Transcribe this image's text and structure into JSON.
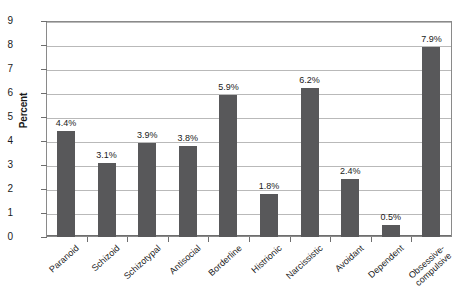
{
  "chart_data": {
    "type": "bar",
    "title": "",
    "xlabel": "",
    "ylabel": "Percent",
    "ylim": [
      0,
      9
    ],
    "yticks": [
      "0",
      "1",
      "2",
      "3",
      "4",
      "5",
      "6",
      "7",
      "8",
      "9"
    ],
    "grid": true,
    "legend": "none",
    "bar_color": "#58585a",
    "gridline_color": "#b9b9b9",
    "plot_border_color": "#8a8a8a",
    "value_suffix": "%",
    "categories": [
      "Paranoid",
      "Schizoid",
      "Schizotypal",
      "Antisocial",
      "Borderline",
      "Histrionic",
      "Narcissistic",
      "Avoidant",
      "Dependent",
      "Obsessive-\ncompulsive"
    ],
    "values": [
      4.4,
      3.1,
      3.9,
      3.8,
      5.9,
      1.8,
      6.2,
      2.4,
      0.5,
      7.9
    ],
    "value_labels": [
      "4.4%",
      "3.1%",
      "3.9%",
      "3.8%",
      "5.9%",
      "1.8%",
      "6.2%",
      "2.4%",
      "0.5%",
      "7.9%"
    ]
  }
}
